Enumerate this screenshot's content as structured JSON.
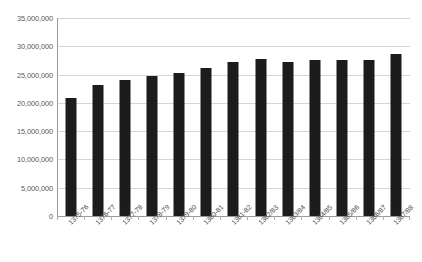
{
  "chart_data": {
    "type": "bar",
    "title": "",
    "subtitle": "",
    "xlabel": "",
    "ylabel": "",
    "categories": [
      "1375-76",
      "1376-77",
      "1377-78",
      "1378-79",
      "1379-80",
      "1380-81",
      "1381-82",
      "1382/83",
      "1383/84",
      "1384/85",
      "1385/86",
      "1386/87",
      "1387/88"
    ],
    "values": [
      20900000,
      23100000,
      24100000,
      24700000,
      25300000,
      26200000,
      27200000,
      27800000,
      27200000,
      27600000,
      27500000,
      27500000,
      28700000
    ],
    "ylim": [
      0,
      35000000
    ],
    "ytick_values": [
      0,
      5000000,
      10000000,
      15000000,
      20000000,
      25000000,
      30000000,
      35000000
    ],
    "ytick_labels": [
      "0",
      "5,000,000",
      "10,000,000",
      "15,000,000",
      "20,000,000",
      "25,000,000",
      "30,000,000",
      "35,000,000"
    ],
    "grid": true,
    "legend": false,
    "legend_position": "none",
    "series_color": "#1c1c1c",
    "gridline_color": "#d6d6d6",
    "axis_color": "#9a9a9a",
    "tick_label_color": "#595959"
  }
}
